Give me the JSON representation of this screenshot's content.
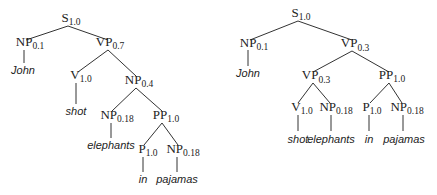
{
  "trees": [
    {
      "id": "left-tree",
      "nodes": [
        {
          "label": "S",
          "prob": "1.0",
          "x": 71,
          "y": 22
        },
        {
          "label": "NP",
          "prob": "0.1",
          "x": 30,
          "y": 46
        },
        {
          "label": "VP",
          "prob": "0.7",
          "x": 110,
          "y": 46
        },
        {
          "label": "V",
          "prob": "1.0",
          "x": 81,
          "y": 79
        },
        {
          "label": "NP",
          "prob": "0.4",
          "x": 139,
          "y": 84
        },
        {
          "label": "NP",
          "prob": "0.18",
          "x": 116,
          "y": 119
        },
        {
          "label": "PP",
          "prob": "1.0",
          "x": 165,
          "y": 119
        },
        {
          "label": "P",
          "prob": "1.0",
          "x": 148,
          "y": 153
        },
        {
          "label": "NP",
          "prob": "0.18",
          "x": 182,
          "y": 153
        }
      ],
      "words": [
        {
          "text": "John",
          "x": 22,
          "y": 73
        },
        {
          "text": "shot",
          "x": 80,
          "y": 113
        },
        {
          "text": "elephants",
          "x": 113,
          "y": 148
        },
        {
          "text": "in",
          "x": 140,
          "y": 182
        },
        {
          "text": "pajamas",
          "x": 177,
          "y": 182
        }
      ]
    },
    {
      "id": "right-tree",
      "nodes": [
        {
          "label": "S",
          "prob": "1.0",
          "x": 300,
          "y": 16
        },
        {
          "label": "NP",
          "prob": "0.1",
          "x": 254,
          "y": 46
        },
        {
          "label": "VP",
          "prob": "0.3",
          "x": 354,
          "y": 46
        },
        {
          "label": "VP",
          "prob": "0.3",
          "x": 315,
          "y": 79
        },
        {
          "label": "PP",
          "prob": "1.0",
          "x": 391,
          "y": 79
        },
        {
          "label": "V",
          "prob": "1.0",
          "x": 301,
          "y": 111
        },
        {
          "label": "NP",
          "prob": "0.18",
          "x": 335,
          "y": 111
        },
        {
          "label": "P",
          "prob": "1.0",
          "x": 371,
          "y": 111
        },
        {
          "label": "NP",
          "prob": "0.18",
          "x": 406,
          "y": 111
        }
      ],
      "words": [
        {
          "text": "John",
          "x": 244,
          "y": 75
        },
        {
          "text": "shot",
          "x": 294,
          "y": 142
        },
        {
          "text": "elephants",
          "x": 335,
          "y": 142
        },
        {
          "text": "in",
          "x": 369,
          "y": 142
        },
        {
          "text": "pajamas",
          "x": 404,
          "y": 142
        }
      ]
    }
  ]
}
